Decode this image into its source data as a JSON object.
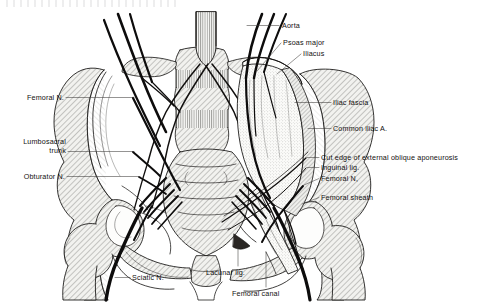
{
  "figure": {
    "top_margin_artifact": "",
    "line_color": "#12100f",
    "bone_fill": "#e9e9e6",
    "muscle_fill": "#f5f5f2",
    "nerve_color": "#0d0c0c",
    "background": "#ffffff"
  },
  "labels": {
    "aorta": {
      "text": "Aorta",
      "side": "right",
      "x": 282,
      "y": 22,
      "leader": [
        [
          279,
          26
        ],
        [
          246,
          26
        ]
      ]
    },
    "psoas_major": {
      "text": "Psoas major",
      "side": "right",
      "x": 283,
      "y": 39,
      "leader": [
        [
          281,
          44
        ],
        [
          256,
          72
        ]
      ]
    },
    "iliacus": {
      "text": "Iliacus",
      "side": "right",
      "x": 303,
      "y": 50,
      "leader": [
        [
          301,
          55
        ],
        [
          276,
          75
        ]
      ]
    },
    "iliac_fascia": {
      "text": "Iliac fascia",
      "side": "right",
      "x": 333,
      "y": 99,
      "leader": [
        [
          331,
          103
        ],
        [
          294,
          103
        ]
      ]
    },
    "common_iliac_a": {
      "text": "Common iliac A.",
      "side": "right",
      "x": 333,
      "y": 125,
      "leader": [
        [
          331,
          129
        ],
        [
          307,
          129
        ]
      ]
    },
    "cut_edge_external_oblique": {
      "text": "Cut edge of external oblique aponeurosis",
      "side": "right",
      "x": 321,
      "y": 154,
      "leader": [
        [
          319,
          158
        ],
        [
          306,
          158
        ]
      ]
    },
    "inguinal_lig": {
      "text": "Inguinal lig.",
      "side": "right",
      "x": 321,
      "y": 164,
      "leader": [
        [
          319,
          168
        ],
        [
          306,
          168
        ]
      ]
    },
    "femoral_n_right": {
      "text": "Femoral N,",
      "side": "right",
      "x": 321,
      "y": 175,
      "leader": [
        [
          319,
          179
        ],
        [
          303,
          186
        ]
      ]
    },
    "femoral_sheath": {
      "text": "Femoral sheath",
      "side": "right",
      "x": 321,
      "y": 194,
      "leader": [
        [
          319,
          198
        ],
        [
          301,
          205
        ]
      ]
    },
    "femoral_n_left": {
      "text": "Femoral N.",
      "side": "left",
      "x": 12,
      "y": 94,
      "leader": [
        [
          66,
          98
        ],
        [
          133,
          98
        ]
      ]
    },
    "lumbosacral_trunk_line1": {
      "text": "Lumbosacral",
      "side": "left",
      "x": 12,
      "y": 138,
      "leader": [
        [
          68,
          152
        ],
        [
          133,
          152
        ]
      ]
    },
    "lumbosacral_trunk_line2": {
      "text": "trunk",
      "side": "left",
      "x": 12,
      "y": 147
    },
    "obturator_n": {
      "text": "Obturator N.",
      "side": "left",
      "x": 12,
      "y": 173,
      "leader": [
        [
          67,
          177
        ],
        [
          139,
          177
        ]
      ]
    },
    "sciatic_n": {
      "text": "Sciatic N.",
      "side": "right",
      "x": 132,
      "y": 274,
      "leader": [
        [
          130,
          278
        ],
        [
          114,
          278
        ]
      ]
    },
    "lacunar_lig": {
      "text": "Lacunar lig.",
      "side": "center",
      "x": 210,
      "y": 269,
      "leader": [
        [
          238,
          268
        ],
        [
          238,
          248
        ]
      ]
    },
    "femoral_canal": {
      "text": "Femoral canal",
      "side": "center",
      "x": 235,
      "y": 290,
      "leader": [
        [
          266,
          289
        ],
        [
          266,
          252
        ]
      ]
    }
  }
}
